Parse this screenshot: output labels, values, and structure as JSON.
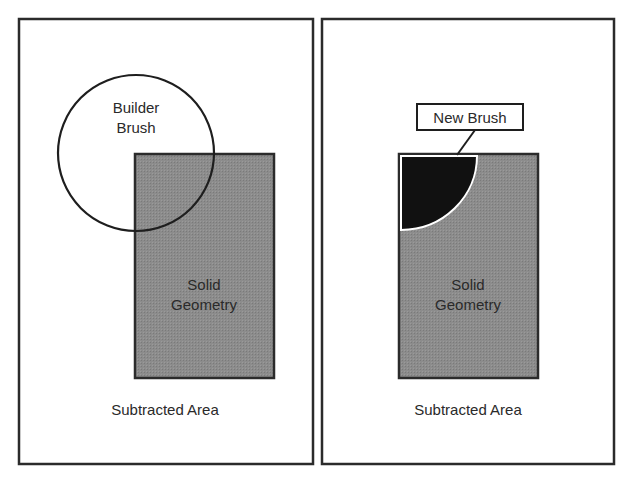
{
  "panels": [
    {
      "id": "left",
      "circle_label": [
        "Builder",
        "Brush"
      ],
      "solid_label": [
        "Solid",
        "Geometry"
      ],
      "area_label": "Subtracted Area"
    },
    {
      "id": "right",
      "callout_label": "New Brush",
      "solid_label": [
        "Solid",
        "Geometry"
      ],
      "area_label": "Subtracted Area"
    }
  ],
  "colors": {
    "border": "#2b2b2b",
    "solid_fill": "#8a8a8a",
    "new_brush_fill": "#111111",
    "background": "#ffffff"
  }
}
